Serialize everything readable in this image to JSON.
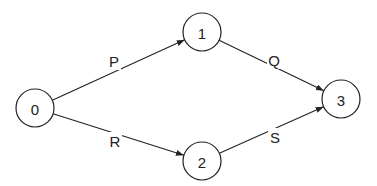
{
  "diagram": {
    "type": "directed-graph",
    "nodes": [
      {
        "id": "0",
        "label": "0"
      },
      {
        "id": "1",
        "label": "1"
      },
      {
        "id": "2",
        "label": "2"
      },
      {
        "id": "3",
        "label": "3"
      }
    ],
    "edges": [
      {
        "from": "0",
        "to": "1",
        "label": "P"
      },
      {
        "from": "1",
        "to": "3",
        "label": "Q"
      },
      {
        "from": "0",
        "to": "2",
        "label": "R"
      },
      {
        "from": "2",
        "to": "3",
        "label": "S"
      }
    ]
  }
}
